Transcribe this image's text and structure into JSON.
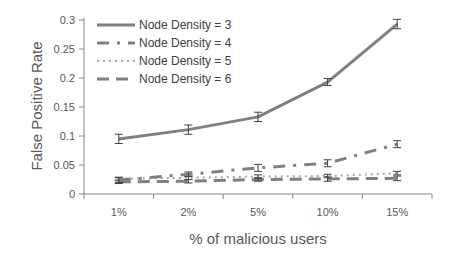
{
  "chart_data": {
    "type": "line",
    "title": "",
    "xlabel": "% of malicious users",
    "ylabel": "False Positive Rate",
    "categories": [
      "1%",
      "2%",
      "5%",
      "10%",
      "15%"
    ],
    "ylim": [
      0,
      0.3
    ],
    "yticks": [
      0,
      0.05,
      0.1,
      0.15,
      0.2,
      0.25,
      0.3
    ],
    "ytick_labels": [
      "0",
      "0.05",
      "0.1",
      "0.15",
      "0.2",
      "0.25",
      "0.3"
    ],
    "grid": false,
    "legend_position": "upper-left (inside)",
    "error_bars": true,
    "series": [
      {
        "name": "Node Density = 3",
        "style": "solid",
        "color": "#808080",
        "values": [
          0.095,
          0.111,
          0.133,
          0.193,
          0.293
        ],
        "errors": [
          0.008,
          0.008,
          0.008,
          0.006,
          0.008
        ]
      },
      {
        "name": "Node Density = 4",
        "style": "dash-dot",
        "color": "#808080",
        "values": [
          0.024,
          0.034,
          0.045,
          0.053,
          0.086
        ],
        "errors": [
          0.004,
          0.004,
          0.006,
          0.006,
          0.006
        ]
      },
      {
        "name": "Node Density = 5",
        "style": "dotted",
        "color": "#a6a6a6",
        "values": [
          0.026,
          0.028,
          0.03,
          0.031,
          0.036
        ],
        "errors": [
          0.003,
          0.003,
          0.003,
          0.003,
          0.003
        ]
      },
      {
        "name": "Node Density = 6",
        "style": "dashed",
        "color": "#808080",
        "values": [
          0.021,
          0.022,
          0.025,
          0.026,
          0.027
        ],
        "errors": [
          0.003,
          0.003,
          0.003,
          0.004,
          0.004
        ]
      }
    ]
  },
  "legend": {
    "items": [
      {
        "label": "Node Density = 3"
      },
      {
        "label": "Node Density = 4"
      },
      {
        "label": "Node Density = 5"
      },
      {
        "label": "Node Density = 6"
      }
    ]
  },
  "axes": {
    "x_title": "% of malicious users",
    "y_title": "False Positive Rate",
    "x_labels": [
      "1%",
      "2%",
      "5%",
      "10%",
      "15%"
    ],
    "y_labels": [
      "0",
      "0.05",
      "0.1",
      "0.15",
      "0.2",
      "0.25",
      "0.3"
    ]
  }
}
